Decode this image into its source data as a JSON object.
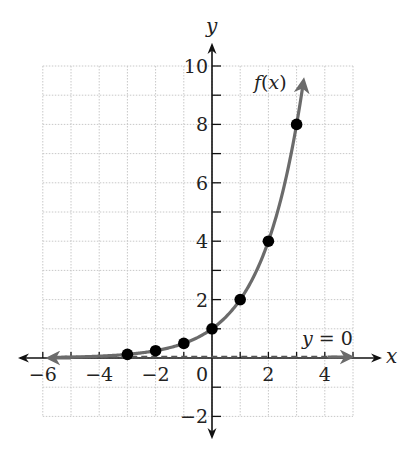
{
  "chart_data": {
    "type": "line",
    "title": "",
    "xlabel": "x",
    "ylabel": "y",
    "xlim": [
      -6,
      5
    ],
    "ylim": [
      -2,
      10
    ],
    "grid": true,
    "x_ticks": [
      -6,
      -4,
      -2,
      0,
      2,
      4
    ],
    "y_ticks": [
      -2,
      2,
      4,
      6,
      8,
      10
    ],
    "series": [
      {
        "name": "f(x)",
        "function": "2^x",
        "color": "#6b6b6b",
        "points": [
          {
            "x": -3,
            "y": 0.125
          },
          {
            "x": -2,
            "y": 0.25
          },
          {
            "x": -1,
            "y": 0.5
          },
          {
            "x": 0,
            "y": 1
          },
          {
            "x": 1,
            "y": 2
          },
          {
            "x": 2,
            "y": 4
          },
          {
            "x": 3,
            "y": 8
          }
        ]
      },
      {
        "name": "y = 0",
        "type": "asymptote",
        "style": "dashed",
        "y": 0
      }
    ],
    "annotations": [
      {
        "text": "f(x)",
        "near": {
          "x": 2.3,
          "y": 9.6
        }
      },
      {
        "text": "y = 0",
        "near": {
          "x": 3.8,
          "y": 0.5
        }
      }
    ]
  },
  "labels": {
    "x_axis": "x",
    "y_axis": "y",
    "curve": "f(x)",
    "asymptote": "y = 0",
    "xticks": [
      "−6",
      "−4",
      "−2",
      "0",
      "2",
      "4"
    ],
    "yticks": [
      "10",
      "8",
      "6",
      "4",
      "2",
      "−2"
    ]
  }
}
